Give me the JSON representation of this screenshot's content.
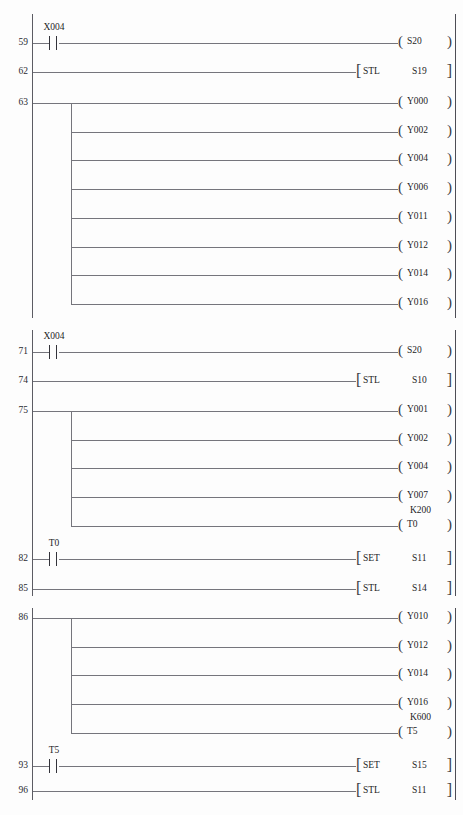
{
  "diagram": {
    "type": "plc-ladder-logic",
    "blocks": [
      {
        "id": "block-1",
        "rungs": [
          {
            "number": "59",
            "contact": {
              "label": "X004",
              "type": "normally-open"
            },
            "output": {
              "kind": "coil",
              "label": "S20"
            }
          },
          {
            "number": "62",
            "output": {
              "kind": "instruction",
              "op": "STL",
              "operand": "S19"
            }
          },
          {
            "number": "63",
            "branch": true,
            "outputs": [
              {
                "kind": "coil",
                "label": "Y000"
              },
              {
                "kind": "coil",
                "label": "Y002"
              },
              {
                "kind": "coil",
                "label": "Y004"
              },
              {
                "kind": "coil",
                "label": "Y006"
              },
              {
                "kind": "coil",
                "label": "Y011"
              },
              {
                "kind": "coil",
                "label": "Y012"
              },
              {
                "kind": "coil",
                "label": "Y014"
              },
              {
                "kind": "coil",
                "label": "Y016"
              }
            ]
          }
        ]
      },
      {
        "id": "block-2",
        "rungs": [
          {
            "number": "71",
            "contact": {
              "label": "X004",
              "type": "normally-open"
            },
            "output": {
              "kind": "coil",
              "label": "S20"
            }
          },
          {
            "number": "74",
            "output": {
              "kind": "instruction",
              "op": "STL",
              "operand": "S10"
            }
          },
          {
            "number": "75",
            "branch": true,
            "outputs": [
              {
                "kind": "coil",
                "label": "Y001"
              },
              {
                "kind": "coil",
                "label": "Y002"
              },
              {
                "kind": "coil",
                "label": "Y004"
              },
              {
                "kind": "coil",
                "label": "Y007"
              },
              {
                "kind": "coil",
                "label": "T0",
                "preset": "K200"
              }
            ]
          },
          {
            "number": "82",
            "contact": {
              "label": "T0",
              "type": "normally-open"
            },
            "output": {
              "kind": "instruction",
              "op": "SET",
              "operand": "S11"
            }
          },
          {
            "number": "85",
            "output": {
              "kind": "instruction",
              "op": "STL",
              "operand": "S14"
            }
          }
        ]
      },
      {
        "id": "block-3",
        "rungs": [
          {
            "number": "86",
            "branch": true,
            "outputs": [
              {
                "kind": "coil",
                "label": "Y010"
              },
              {
                "kind": "coil",
                "label": "Y012"
              },
              {
                "kind": "coil",
                "label": "Y014"
              },
              {
                "kind": "coil",
                "label": "Y016"
              },
              {
                "kind": "coil",
                "label": "T5",
                "preset": "K600"
              }
            ]
          },
          {
            "number": "93",
            "contact": {
              "label": "T5",
              "type": "normally-open"
            },
            "output": {
              "kind": "instruction",
              "op": "SET",
              "operand": "S15"
            }
          },
          {
            "number": "96",
            "output": {
              "kind": "instruction",
              "op": "STL",
              "operand": "S11"
            }
          }
        ]
      }
    ]
  },
  "colors": {
    "background": "#fdfdfd",
    "rail": "#5c5c63",
    "wire": "#75757c",
    "text": "#1d1d1f"
  }
}
